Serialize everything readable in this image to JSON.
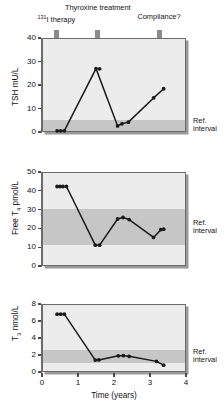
{
  "annotations": [
    {
      "name": "i131-therapy",
      "html_prefix": "131",
      "label": "I therapy",
      "x_year": 0.4
    },
    {
      "name": "thyroxine",
      "html_prefix": "",
      "label": "Thyroxine treatment",
      "x_year": 1.55
    },
    {
      "name": "compliance",
      "html_prefix": "",
      "label": "Compliance?",
      "x_year": 3.25
    }
  ],
  "ref_label_line1": "Ref.",
  "ref_label_line2": "interval",
  "xaxis": {
    "label": "Time (years)",
    "ticks": [
      0,
      1,
      2,
      3,
      4
    ],
    "min": 0,
    "max": 4
  },
  "colors": {
    "plot_bg": "#ececec",
    "ref_band": "#c6c6c6",
    "axis": "#6b6b6b",
    "data": "#1a1a1a",
    "arrow": "#8c8c8c",
    "shadow": "#9a9a9a"
  },
  "chart_data": [
    {
      "type": "line",
      "name": "tsh-panel",
      "title": "",
      "xlabel": "",
      "ylabel": "TSH mU/L",
      "ylabel_plain": "TSH mU/L",
      "xlim": [
        0,
        4
      ],
      "ylim": [
        0,
        40
      ],
      "yticks": [
        0,
        10,
        20,
        30,
        40
      ],
      "grid": false,
      "reference_interval": [
        0.4,
        4.8
      ],
      "reference_label": "Ref. interval",
      "x": [
        0.42,
        0.52,
        0.62,
        1.5,
        1.6,
        2.1,
        2.22,
        2.4,
        3.1,
        3.38
      ],
      "y": [
        0.5,
        0.5,
        0.5,
        27.0,
        26.9,
        2.6,
        3.5,
        4.2,
        14.5,
        18.4
      ],
      "series": [
        {
          "name": "TSH",
          "values": [
            0.5,
            0.5,
            0.5,
            27.0,
            26.9,
            2.6,
            3.5,
            4.2,
            14.5,
            18.4
          ]
        }
      ],
      "segments": [
        [
          0,
          1
        ],
        [
          1,
          2
        ],
        [
          2,
          3
        ],
        [
          3,
          5
        ],
        [
          5,
          6
        ],
        [
          6,
          7
        ],
        [
          7,
          8
        ],
        [
          8,
          9
        ]
      ]
    },
    {
      "type": "line",
      "name": "free-t4-panel",
      "title": "",
      "xlabel": "",
      "ylabel": "Free T4 pmol/L",
      "ylabel_plain": "Free T",
      "ylabel_sub": "4",
      "ylabel_suffix": " pmol/L",
      "xlim": [
        0,
        4
      ],
      "ylim": [
        0,
        50
      ],
      "yticks": [
        0,
        10,
        20,
        30,
        40,
        50
      ],
      "grid": false,
      "reference_interval": [
        10.8,
        30.0
      ],
      "reference_label": "Ref. interval",
      "x": [
        0.42,
        0.5,
        0.58,
        0.68,
        1.48,
        1.6,
        2.1,
        2.25,
        2.42,
        3.1,
        3.3,
        3.38
      ],
      "y": [
        42.3,
        42.3,
        42.3,
        42.3,
        11.1,
        11.1,
        25.0,
        25.8,
        24.7,
        15.2,
        19.3,
        19.6
      ],
      "series": [
        {
          "name": "Free T4",
          "values": [
            42.3,
            42.3,
            42.3,
            42.3,
            11.1,
            11.1,
            25.0,
            25.8,
            24.7,
            15.2,
            19.3,
            19.6
          ]
        }
      ],
      "segments": [
        [
          0,
          3
        ],
        [
          3,
          4
        ],
        [
          4,
          5
        ],
        [
          5,
          6
        ],
        [
          6,
          7
        ],
        [
          7,
          8
        ],
        [
          8,
          9
        ],
        [
          9,
          10
        ],
        [
          10,
          11
        ]
      ]
    },
    {
      "type": "line",
      "name": "t3-panel",
      "title": "",
      "xlabel": "Time (years)",
      "ylabel": "T3 nmol/L",
      "ylabel_plain": "T",
      "ylabel_sub": "3",
      "ylabel_suffix": " nmol/L",
      "xlim": [
        0,
        4
      ],
      "ylim": [
        0,
        8
      ],
      "yticks": [
        0,
        2,
        4,
        6,
        8
      ],
      "grid": false,
      "reference_interval": [
        1.0,
        2.6
      ],
      "reference_label": "Ref. interval",
      "x": [
        0.42,
        0.52,
        0.62,
        1.48,
        1.58,
        2.12,
        2.26,
        2.42,
        3.18,
        3.38
      ],
      "y": [
        6.8,
        6.8,
        6.8,
        1.4,
        1.42,
        1.9,
        1.92,
        1.85,
        1.25,
        0.8
      ],
      "series": [
        {
          "name": "T3",
          "values": [
            6.8,
            6.8,
            6.8,
            1.4,
            1.42,
            1.9,
            1.92,
            1.85,
            1.25,
            0.8
          ]
        }
      ],
      "segments": [
        [
          0,
          1
        ],
        [
          1,
          2
        ],
        [
          2,
          3
        ],
        [
          3,
          4
        ],
        [
          4,
          5
        ],
        [
          5,
          6
        ],
        [
          6,
          7
        ],
        [
          7,
          8
        ],
        [
          8,
          9
        ]
      ]
    }
  ]
}
